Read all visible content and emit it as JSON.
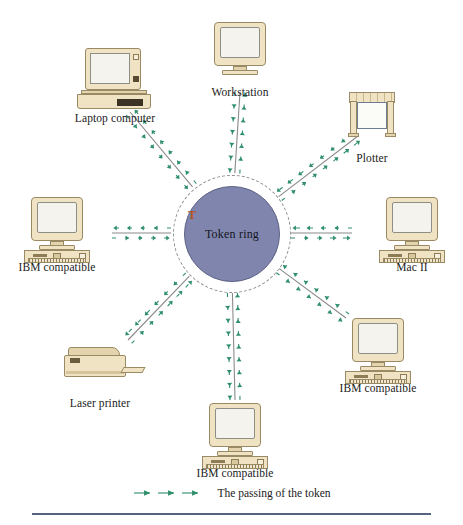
{
  "diagram": {
    "center": {
      "label": "Token ring",
      "token_marker": "T",
      "fill_color": "#7f85ad",
      "ring_style": "dashed"
    },
    "link_style": {
      "line_color": "#8a8a8a",
      "arrow_color": "#2f8f6b",
      "arrow_dash": "dashed",
      "direction": "bidirectional"
    },
    "nodes": [
      {
        "id": "workstation",
        "label": "Workstation",
        "icon": "monitor-icon",
        "angle_deg": 270,
        "x": 240,
        "y": 22
      },
      {
        "id": "laptop",
        "label": "Laptop computer",
        "icon": "laptop-icon",
        "angle_deg": 225,
        "x": 115,
        "y": 48
      },
      {
        "id": "plotter",
        "label": "Plotter",
        "icon": "plotter-icon",
        "angle_deg": 315,
        "x": 372,
        "y": 88
      },
      {
        "id": "ibm-left",
        "label": "IBM compatible",
        "icon": "desktop-pc-icon",
        "angle_deg": 180,
        "x": 57,
        "y": 197
      },
      {
        "id": "mac-ii",
        "label": "Mac II",
        "icon": "desktop-pc-icon",
        "angle_deg": 0,
        "x": 412,
        "y": 197
      },
      {
        "id": "laser-printer",
        "label": "Laser printer",
        "icon": "laser-printer-icon",
        "angle_deg": 135,
        "x": 100,
        "y": 333
      },
      {
        "id": "ibm-lower-right",
        "label": "IBM compatible",
        "icon": "desktop-pc-icon",
        "angle_deg": 45,
        "x": 378,
        "y": 318
      },
      {
        "id": "ibm-bottom",
        "label": "IBM compatible",
        "icon": "desktop-pc-icon",
        "angle_deg": 90,
        "x": 235,
        "y": 403
      }
    ],
    "legend": {
      "text": "The passing of the token",
      "swatch": "green-dashed-arrow"
    }
  }
}
